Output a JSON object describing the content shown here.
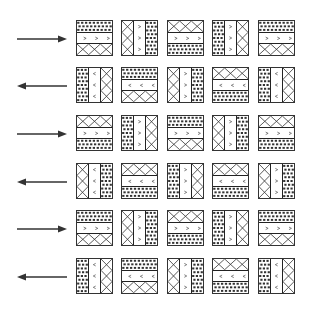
{
  "figure": {
    "colors": {
      "stroke": "#333333",
      "background": "#ffffff"
    },
    "rows": [
      {
        "arrow": "right",
        "tiles": [
          {
            "orientation": "horizontal",
            "bands": [
              "dots",
              "chevron-right",
              "cross"
            ]
          },
          {
            "orientation": "vertical",
            "bands": [
              "cross",
              "chevron-right",
              "dots"
            ]
          },
          {
            "orientation": "horizontal",
            "bands": [
              "cross",
              "chevron-right",
              "dots"
            ]
          },
          {
            "orientation": "vertical",
            "bands": [
              "dots",
              "chevron-right",
              "cross"
            ]
          },
          {
            "orientation": "horizontal",
            "bands": [
              "dots",
              "chevron-right",
              "cross"
            ]
          }
        ]
      },
      {
        "arrow": "left",
        "tiles": [
          {
            "orientation": "vertical",
            "bands": [
              "dots",
              "chevron-left",
              "cross"
            ]
          },
          {
            "orientation": "horizontal",
            "bands": [
              "dots",
              "chevron-left",
              "cross"
            ]
          },
          {
            "orientation": "vertical",
            "bands": [
              "cross",
              "chevron-right",
              "dots"
            ]
          },
          {
            "orientation": "horizontal",
            "bands": [
              "cross",
              "chevron-left",
              "dots"
            ]
          },
          {
            "orientation": "vertical",
            "bands": [
              "dots",
              "chevron-left",
              "cross"
            ]
          }
        ]
      },
      {
        "arrow": "right",
        "tiles": [
          {
            "orientation": "horizontal",
            "bands": [
              "cross",
              "chevron-right",
              "dots"
            ]
          },
          {
            "orientation": "vertical",
            "bands": [
              "dots",
              "chevron-right",
              "cross"
            ]
          },
          {
            "orientation": "horizontal",
            "bands": [
              "dots",
              "chevron-right",
              "cross"
            ]
          },
          {
            "orientation": "vertical",
            "bands": [
              "cross",
              "chevron-right",
              "dots"
            ]
          },
          {
            "orientation": "horizontal",
            "bands": [
              "cross",
              "chevron-right",
              "dots"
            ]
          }
        ]
      },
      {
        "arrow": "left",
        "tiles": [
          {
            "orientation": "vertical",
            "bands": [
              "cross",
              "chevron-left",
              "dots"
            ]
          },
          {
            "orientation": "horizontal",
            "bands": [
              "cross",
              "chevron-left",
              "dots"
            ]
          },
          {
            "orientation": "vertical",
            "bands": [
              "dots",
              "chevron-right",
              "cross"
            ]
          },
          {
            "orientation": "horizontal",
            "bands": [
              "cross",
              "chevron-left",
              "dots"
            ]
          },
          {
            "orientation": "vertical",
            "bands": [
              "cross",
              "chevron-right",
              "dots"
            ]
          }
        ]
      },
      {
        "arrow": "right",
        "tiles": [
          {
            "orientation": "horizontal",
            "bands": [
              "dots",
              "chevron-right",
              "cross"
            ]
          },
          {
            "orientation": "vertical",
            "bands": [
              "cross",
              "chevron-right",
              "dots"
            ]
          },
          {
            "orientation": "horizontal",
            "bands": [
              "cross",
              "chevron-right",
              "dots"
            ]
          },
          {
            "orientation": "vertical",
            "bands": [
              "dots",
              "chevron-right",
              "cross"
            ]
          },
          {
            "orientation": "horizontal",
            "bands": [
              "dots",
              "chevron-right",
              "cross"
            ]
          }
        ]
      },
      {
        "arrow": "left",
        "tiles": [
          {
            "orientation": "vertical",
            "bands": [
              "dots",
              "chevron-left",
              "cross"
            ]
          },
          {
            "orientation": "horizontal",
            "bands": [
              "dots",
              "chevron-left",
              "cross"
            ]
          },
          {
            "orientation": "vertical",
            "bands": [
              "cross",
              "chevron-right",
              "dots"
            ]
          },
          {
            "orientation": "horizontal",
            "bands": [
              "cross",
              "chevron-left",
              "dots"
            ]
          },
          {
            "orientation": "vertical",
            "bands": [
              "dots",
              "chevron-left",
              "cross"
            ]
          }
        ]
      }
    ]
  }
}
